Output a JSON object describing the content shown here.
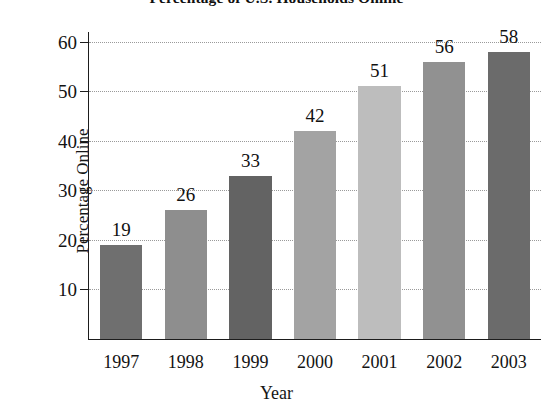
{
  "chart_data": {
    "type": "bar",
    "title": "Percentage of U.S. Households Online",
    "xlabel": "Year",
    "ylabel": "Percentage Online",
    "categories": [
      "1997",
      "1998",
      "1999",
      "2000",
      "2001",
      "2002",
      "2003"
    ],
    "values": [
      19,
      26,
      33,
      42,
      51,
      56,
      58
    ],
    "value_labels": [
      "19",
      "26",
      "33",
      "42",
      "51",
      "56",
      "58"
    ],
    "ylim": [
      0,
      62
    ],
    "yticks": [
      10,
      20,
      30,
      40,
      50,
      60
    ],
    "ytick_labels": [
      "10",
      "20",
      "30",
      "40",
      "50",
      "60"
    ],
    "grid": "horizontal-dotted",
    "legend": "none",
    "bar_colors": [
      "#6f6f6f",
      "#8e8e8e",
      "#636363",
      "#a3a3a3",
      "#bdbdbd",
      "#919191",
      "#6b6b6b"
    ],
    "axis_color": "#1d1d1d",
    "grid_color": "#9a9a9a",
    "background": "#ffffff"
  }
}
